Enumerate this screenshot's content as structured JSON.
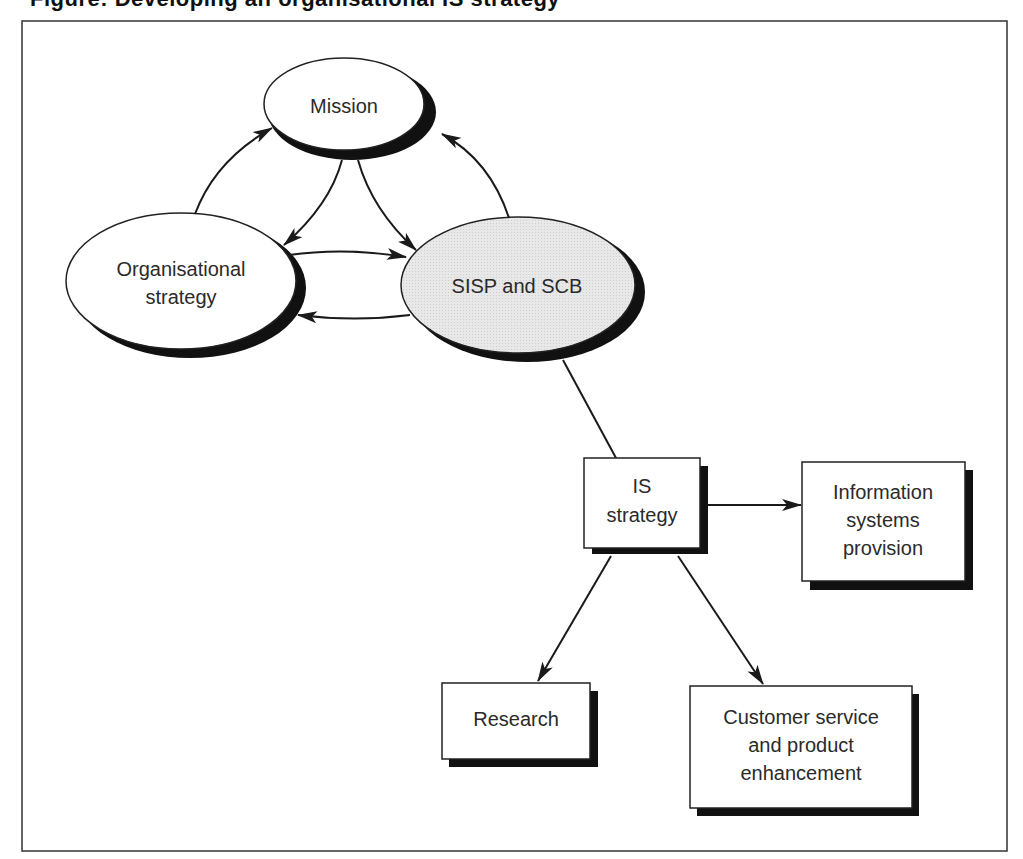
{
  "figure": {
    "title_partial": "Figure: Developing an organisational IS strategy",
    "frame_color": "#333333",
    "shadow_color": "#111111",
    "highlight_fill": "#e6e6e6"
  },
  "nodes": {
    "mission": {
      "label": "Mission",
      "shape": "ellipse"
    },
    "org_strategy": {
      "label_line1": "Organisational",
      "label_line2": "strategy",
      "shape": "ellipse"
    },
    "sisp_scb": {
      "label": "SISP and SCB",
      "shape": "ellipse",
      "shaded": true
    },
    "is_strategy": {
      "label_line1": "IS",
      "label_line2": "strategy",
      "shape": "box"
    },
    "is_provision": {
      "label_line1": "Information",
      "label_line2": "systems",
      "label_line3": "provision",
      "shape": "box"
    },
    "research": {
      "label": "Research",
      "shape": "box"
    },
    "customer_service": {
      "label_line1": "Customer service",
      "label_line2": "and product",
      "label_line3": "enhancement",
      "shape": "box"
    }
  },
  "edges": [
    {
      "from": "org_strategy",
      "to": "mission",
      "type": "arrow"
    },
    {
      "from": "mission",
      "to": "org_strategy",
      "type": "arrow"
    },
    {
      "from": "mission",
      "to": "sisp_scb",
      "type": "arrow"
    },
    {
      "from": "sisp_scb",
      "to": "mission",
      "type": "arrow"
    },
    {
      "from": "org_strategy",
      "to": "sisp_scb",
      "type": "arrow"
    },
    {
      "from": "sisp_scb",
      "to": "org_strategy",
      "type": "arrow"
    },
    {
      "from": "sisp_scb",
      "to": "is_strategy",
      "type": "line"
    },
    {
      "from": "is_strategy",
      "to": "is_provision",
      "type": "arrow"
    },
    {
      "from": "is_strategy",
      "to": "research",
      "type": "arrow"
    },
    {
      "from": "is_strategy",
      "to": "customer_service",
      "type": "arrow"
    }
  ]
}
